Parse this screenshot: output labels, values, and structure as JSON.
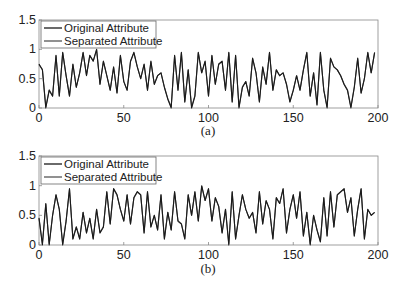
{
  "chart_data": [
    {
      "type": "line",
      "caption": "(a)",
      "title": "",
      "xlabel": "",
      "ylabel": "",
      "xlim": [
        0,
        200
      ],
      "ylim": [
        0,
        1.5
      ],
      "xticks": [
        "0",
        "50",
        "100",
        "150",
        "200"
      ],
      "yticks": [
        "0",
        "0.5",
        "1",
        "1.5"
      ],
      "grid": false,
      "legend_position": "upper left",
      "legend": [
        "Original Attribute",
        "Separated Attribute"
      ],
      "x_step": 2,
      "series": [
        {
          "name": "Original Attribute",
          "color": "#1a1a1a",
          "values": [
            0.75,
            0.65,
            0.0,
            0.3,
            0.2,
            0.9,
            0.2,
            0.95,
            0.55,
            0.2,
            0.75,
            0.35,
            0.6,
            0.95,
            0.55,
            0.9,
            0.8,
            1.0,
            0.4,
            0.8,
            0.55,
            0.3,
            0.7,
            0.25,
            0.9,
            0.45,
            0.3,
            0.8,
            0.95,
            0.7,
            0.5,
            0.75,
            0.3,
            0.8,
            0.4,
            0.55,
            0.6,
            0.35,
            0.15,
            0.0,
            0.9,
            0.3,
            0.95,
            0.1,
            0.65,
            0.0,
            0.2,
            0.95,
            0.6,
            0.8,
            0.2,
            0.9,
            0.4,
            0.75,
            0.8,
            0.3,
            0.95,
            0.1,
            0.9,
            0.0,
            0.35,
            0.45,
            0.2,
            0.85,
            0.6,
            0.1,
            0.7,
            0.4,
            0.95,
            0.3,
            0.65,
            0.55,
            0.6,
            0.4,
            0.1,
            0.3,
            0.55,
            0.3,
            0.65,
            0.95,
            0.2,
            0.6,
            0.05,
            0.95,
            0.3,
            0.0,
            0.85,
            0.7,
            0.65,
            0.55,
            0.4,
            0.3,
            0.0,
            0.35,
            0.85,
            0.25,
            0.5,
            0.95,
            0.6,
            0.95
          ]
        },
        {
          "name": "Separated Attribute",
          "color": "#555555",
          "values": [
            0.74,
            0.66,
            0.02,
            0.31,
            0.21,
            0.89,
            0.21,
            0.94,
            0.55,
            0.21,
            0.74,
            0.36,
            0.6,
            0.94,
            0.56,
            0.89,
            0.8,
            0.99,
            0.41,
            0.79,
            0.55,
            0.31,
            0.69,
            0.26,
            0.89,
            0.45,
            0.31,
            0.79,
            0.94,
            0.7,
            0.5,
            0.74,
            0.31,
            0.79,
            0.41,
            0.55,
            0.6,
            0.36,
            0.16,
            0.02,
            0.89,
            0.31,
            0.94,
            0.11,
            0.65,
            0.02,
            0.21,
            0.94,
            0.6,
            0.79,
            0.21,
            0.89,
            0.41,
            0.74,
            0.79,
            0.31,
            0.94,
            0.11,
            0.89,
            0.02,
            0.36,
            0.45,
            0.21,
            0.84,
            0.6,
            0.11,
            0.69,
            0.41,
            0.94,
            0.31,
            0.65,
            0.55,
            0.6,
            0.41,
            0.11,
            0.31,
            0.55,
            0.31,
            0.65,
            0.94,
            0.21,
            0.6,
            0.06,
            0.94,
            0.31,
            0.02,
            0.84,
            0.7,
            0.65,
            0.55,
            0.41,
            0.31,
            0.02,
            0.36,
            0.84,
            0.26,
            0.5,
            0.94,
            0.6,
            0.94
          ]
        }
      ]
    },
    {
      "type": "line",
      "caption": "(b)",
      "title": "",
      "xlabel": "",
      "ylabel": "",
      "xlim": [
        0,
        200
      ],
      "ylim": [
        0,
        1.5
      ],
      "xticks": [
        "0",
        "50",
        "100",
        "150",
        "200"
      ],
      "yticks": [
        "0",
        "0.5",
        "1",
        "1.5"
      ],
      "grid": false,
      "legend_position": "upper left",
      "legend": [
        "Original Attribute",
        "Separated Attribute"
      ],
      "x_step": 2,
      "series": [
        {
          "name": "Original Attribute",
          "color": "#1a1a1a",
          "values": [
            0.45,
            0.0,
            0.7,
            0.0,
            0.5,
            0.85,
            0.6,
            0.0,
            0.4,
            0.95,
            0.1,
            0.3,
            0.1,
            0.55,
            0.2,
            0.45,
            0.1,
            0.6,
            0.2,
            0.3,
            0.9,
            0.35,
            0.95,
            0.85,
            0.6,
            0.4,
            0.85,
            0.35,
            0.8,
            0.9,
            0.85,
            0.2,
            0.9,
            0.3,
            0.5,
            0.25,
            0.85,
            0.1,
            0.55,
            0.25,
            0.9,
            0.4,
            0.35,
            0.1,
            0.85,
            0.5,
            0.9,
            0.4,
            1.0,
            0.75,
            0.95,
            0.4,
            0.8,
            0.65,
            0.2,
            0.6,
            0.0,
            0.9,
            0.1,
            0.5,
            0.85,
            0.6,
            0.45,
            0.55,
            0.2,
            0.9,
            0.35,
            0.75,
            0.6,
            0.1,
            0.8,
            0.7,
            0.95,
            0.2,
            0.6,
            0.85,
            0.45,
            0.9,
            0.15,
            0.55,
            0.0,
            0.5,
            0.25,
            0.05,
            0.8,
            0.15,
            0.9,
            0.3,
            0.85,
            0.9,
            0.95,
            0.55,
            0.8,
            0.15,
            0.6,
            0.95,
            0.1,
            0.6,
            0.5,
            0.55
          ]
        },
        {
          "name": "Separated Attribute",
          "color": "#555555",
          "values": [
            0.46,
            0.02,
            0.69,
            0.02,
            0.5,
            0.84,
            0.6,
            0.02,
            0.41,
            0.94,
            0.11,
            0.31,
            0.11,
            0.55,
            0.21,
            0.45,
            0.11,
            0.6,
            0.21,
            0.31,
            0.89,
            0.36,
            0.94,
            0.84,
            0.6,
            0.41,
            0.84,
            0.36,
            0.79,
            0.89,
            0.84,
            0.21,
            0.89,
            0.31,
            0.5,
            0.26,
            0.84,
            0.11,
            0.55,
            0.26,
            0.89,
            0.41,
            0.36,
            0.11,
            0.84,
            0.5,
            0.89,
            0.41,
            0.99,
            0.75,
            0.94,
            0.41,
            0.79,
            0.65,
            0.21,
            0.6,
            0.02,
            0.89,
            0.11,
            0.5,
            0.84,
            0.6,
            0.45,
            0.55,
            0.21,
            0.89,
            0.36,
            0.74,
            0.6,
            0.11,
            0.79,
            0.7,
            0.94,
            0.21,
            0.6,
            0.84,
            0.45,
            0.89,
            0.16,
            0.55,
            0.02,
            0.5,
            0.26,
            0.06,
            0.79,
            0.16,
            0.89,
            0.31,
            0.84,
            0.89,
            0.94,
            0.55,
            0.79,
            0.16,
            0.6,
            0.94,
            0.11,
            0.6,
            0.5,
            0.55
          ]
        }
      ]
    }
  ]
}
